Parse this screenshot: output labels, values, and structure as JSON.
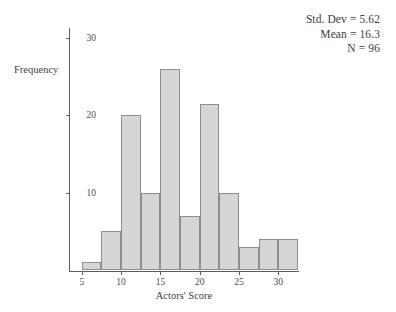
{
  "chart_data": {
    "type": "bar",
    "title": "",
    "subtitle": "",
    "xlabel": "Actors' Score",
    "ylabel": "Frequency",
    "bin_width": 5,
    "bin_starts": [
      5,
      7.5,
      10,
      12.5,
      15,
      17.5,
      20,
      22.5,
      25,
      27.5,
      30
    ],
    "categories": [
      "5",
      "7.5",
      "10",
      "12.5",
      "15",
      "17.5",
      "20",
      "22.5",
      "25",
      "27.5",
      "30"
    ],
    "values": [
      1,
      5,
      20,
      10,
      26,
      7,
      21.5,
      10,
      3,
      4,
      4
    ],
    "xlim": [
      3.5,
      32.5
    ],
    "ylim": [
      0,
      31
    ],
    "xticks": [
      5,
      10,
      15,
      20,
      25,
      30
    ],
    "xtick_labels": [
      "5",
      "10",
      "15",
      "20",
      "25",
      "30"
    ],
    "yticks": [
      10,
      20,
      30
    ],
    "ytick_labels": [
      "10",
      "20",
      "30"
    ],
    "grid": false,
    "legend": "none",
    "bar_fill_color": "#d6d6d6",
    "bar_border_color": "#8e8e8e",
    "axis_color": "#5d5d5d"
  },
  "annotations": {
    "std_dev": "Std. Dev = 5.62",
    "mean": "Mean = 16.3",
    "n": "N = 96"
  }
}
